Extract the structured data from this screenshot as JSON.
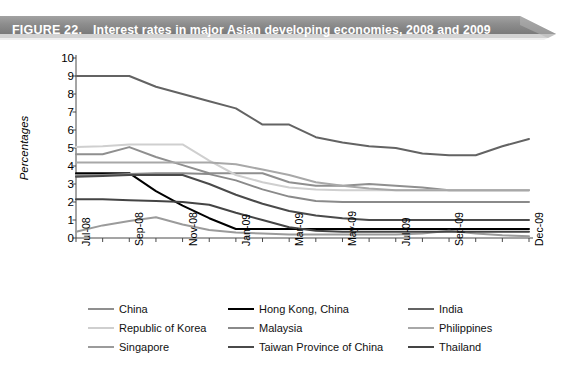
{
  "figure": {
    "label": "FIGURE 22.",
    "title": "Interest rates in major Asian developing economies, 2008 and 2009",
    "banner_color": "#8c8c8c",
    "banner_text_color": "#ffffff"
  },
  "chart_data": {
    "type": "line",
    "title": "Interest rates in major Asian developing economies, 2008 and 2009",
    "xlabel": "",
    "ylabel": "Percentages",
    "ylim": [
      0,
      10
    ],
    "ytick_labels": [
      "0",
      "1",
      "2",
      "3",
      "4",
      "5",
      "6",
      "7",
      "8",
      "9",
      "10"
    ],
    "grid": false,
    "legend_position": "bottom",
    "x": [
      "Jul-08",
      "Aug-08",
      "Sep-08",
      "Oct-08",
      "Nov-08",
      "Dec-08",
      "Jan-09",
      "Feb-09",
      "Mar-09",
      "Apr-09",
      "May-09",
      "Jun-09",
      "Jul-09",
      "Aug-09",
      "Sep-09",
      "Oct-09",
      "Nov-09",
      "Dec-09"
    ],
    "xtick_labels": [
      "Jul-08",
      "Sep-08",
      "Nov-08",
      "Jan-09",
      "Mar-09",
      "May-09",
      "Jul-09",
      "Sep-09",
      "Dec-09"
    ],
    "xtick_indices": [
      0,
      2,
      4,
      6,
      8,
      10,
      12,
      14,
      17
    ],
    "series": [
      {
        "name": "China",
        "color": "#8f8f8f",
        "values": [
          4.65,
          4.65,
          5.05,
          4.5,
          4.05,
          3.6,
          3.6,
          3.6,
          3.1,
          2.9,
          2.9,
          3.0,
          2.9,
          2.8,
          2.65,
          2.65,
          2.65,
          2.65
        ]
      },
      {
        "name": "Hong Kong, China",
        "color": "#000000",
        "values": [
          3.6,
          3.6,
          3.6,
          2.6,
          1.8,
          1.1,
          0.5,
          0.5,
          0.5,
          0.5,
          0.5,
          0.5,
          0.5,
          0.5,
          0.5,
          0.5,
          0.5,
          0.5
        ]
      },
      {
        "name": "India",
        "color": "#636363",
        "values": [
          9.0,
          9.0,
          9.0,
          8.4,
          8.0,
          7.6,
          7.2,
          6.3,
          6.3,
          5.6,
          5.3,
          5.1,
          5.0,
          4.7,
          4.6,
          4.6,
          5.1,
          5.5
        ]
      },
      {
        "name": "Republic of Korea",
        "color": "#cfcfcf",
        "values": [
          5.05,
          5.1,
          5.2,
          5.2,
          5.2,
          4.3,
          3.5,
          3.1,
          2.8,
          2.7,
          2.65,
          2.65,
          2.65,
          2.65,
          2.65,
          2.65,
          2.65,
          2.65
        ]
      },
      {
        "name": "Malaysia",
        "color": "#8a8a8a",
        "values": [
          3.5,
          3.5,
          3.55,
          3.6,
          3.6,
          3.55,
          3.2,
          2.7,
          2.3,
          2.05,
          2.0,
          2.0,
          2.0,
          2.0,
          2.0,
          2.0,
          2.0,
          2.0
        ]
      },
      {
        "name": "Philippines",
        "color": "#a8a8a8",
        "values": [
          4.2,
          4.2,
          4.2,
          4.2,
          4.2,
          4.2,
          4.1,
          3.8,
          3.5,
          3.1,
          2.9,
          2.75,
          2.65,
          2.65,
          2.65,
          2.65,
          2.65,
          2.65
        ]
      },
      {
        "name": "Singapore",
        "color": "#9b9b9b",
        "values": [
          0.35,
          0.7,
          0.95,
          1.15,
          0.75,
          0.45,
          0.3,
          0.25,
          0.2,
          0.2,
          0.2,
          0.2,
          0.2,
          0.25,
          0.4,
          0.25,
          0.15,
          0.1
        ]
      },
      {
        "name": "Taiwan Province of China",
        "color": "#4a4a4a",
        "values": [
          3.4,
          3.45,
          3.5,
          3.5,
          3.5,
          3.0,
          2.4,
          1.9,
          1.5,
          1.25,
          1.1,
          1.0,
          1.0,
          1.0,
          1.0,
          1.0,
          1.0,
          1.0
        ]
      },
      {
        "name": "Thailand",
        "color": "#444444",
        "values": [
          2.15,
          2.15,
          2.1,
          2.05,
          2.0,
          1.85,
          1.4,
          1.0,
          0.6,
          0.4,
          0.35,
          0.35,
          0.35,
          0.35,
          0.35,
          0.35,
          0.35,
          0.35
        ]
      }
    ]
  },
  "legend": {
    "rows": [
      [
        "China",
        "Hong Kong, China",
        "India"
      ],
      [
        "Republic of Korea",
        "Malaysia",
        "Philippines"
      ],
      [
        "Singapore",
        "Taiwan Province of China",
        "Thailand"
      ]
    ]
  }
}
